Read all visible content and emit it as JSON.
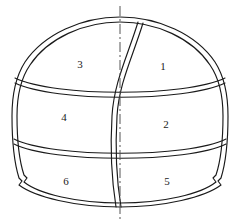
{
  "figure": {
    "type": "diagram",
    "background_color": "#ffffff",
    "line_color": "#1a1a1a",
    "centerline_color": "#555555",
    "label_color": "#1a1a1a",
    "outline_style": "double-line",
    "centerline_style": "dash-dot",
    "symmetry_axis": "vertical"
  },
  "centerline": {
    "name": "vertical-centerline",
    "x": 120,
    "y_top": 6,
    "y_bottom": 220,
    "dash_pattern": "10,3,2,3"
  },
  "outline": {
    "name": "tunnel-profile-outline",
    "description": "Dome / horseshoe tunnel cross-section with double line wall thickness and haunch notches at the base of each side wall",
    "crown_y": 17,
    "invert_y": 207,
    "left_x": 12,
    "right_x": 228,
    "wall_offset_px": 4,
    "notch_left_x": 22,
    "notch_right_x": 218,
    "notch_y": 181
  },
  "dividers": [
    {
      "name": "bench-divider-upper",
      "kind": "horizontal-arc",
      "left_y": 78,
      "right_y": 78,
      "mid_y": 92,
      "bow": "downward"
    },
    {
      "name": "bench-divider-lower",
      "kind": "horizontal-arc",
      "left_y": 139,
      "right_y": 139,
      "mid_y": 152,
      "bow": "downward"
    },
    {
      "name": "central-s-curve-divider",
      "kind": "vertical-s-curve",
      "top_x": 138,
      "top_y": 22,
      "bottom_x": 116,
      "bottom_y": 207,
      "description": "S-shaped vertical partition separating left and right excavation headings"
    }
  ],
  "zones": [
    {
      "id": "zone-1",
      "label": "1",
      "x": 163,
      "y": 66,
      "side": "right",
      "tier": "top"
    },
    {
      "id": "zone-2",
      "label": "2",
      "x": 166,
      "y": 124,
      "side": "right",
      "tier": "middle"
    },
    {
      "id": "zone-3",
      "label": "3",
      "x": 80,
      "y": 64,
      "side": "left",
      "tier": "top"
    },
    {
      "id": "zone-4",
      "label": "4",
      "x": 64,
      "y": 117,
      "side": "left",
      "tier": "middle"
    },
    {
      "id": "zone-5",
      "label": "5",
      "x": 167,
      "y": 181,
      "side": "right",
      "tier": "bottom"
    },
    {
      "id": "zone-6",
      "label": "6",
      "x": 66,
      "y": 181,
      "side": "left",
      "tier": "bottom"
    }
  ]
}
